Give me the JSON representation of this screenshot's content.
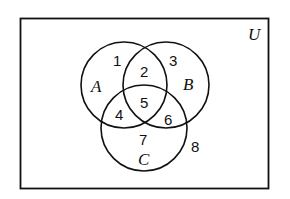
{
  "diagram": {
    "type": "venn",
    "universe_label": "U",
    "sets": [
      {
        "name": "A",
        "cx": 124,
        "cy": 85,
        "r": 43
      },
      {
        "name": "B",
        "cx": 166,
        "cy": 85,
        "r": 43
      },
      {
        "name": "C",
        "cx": 144,
        "cy": 128,
        "r": 43
      }
    ],
    "regions": [
      {
        "label": "1",
        "description": "A only"
      },
      {
        "label": "2",
        "description": "A and B only"
      },
      {
        "label": "3",
        "description": "B only"
      },
      {
        "label": "4",
        "description": "A and C only"
      },
      {
        "label": "5",
        "description": "A, B and C"
      },
      {
        "label": "6",
        "description": "B and C only"
      },
      {
        "label": "7",
        "description": "C only"
      },
      {
        "label": "8",
        "description": "outside A, B, C"
      }
    ],
    "colors": {
      "stroke": "#111111",
      "background": "#ffffff"
    }
  }
}
